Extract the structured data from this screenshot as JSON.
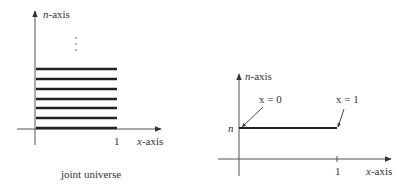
{
  "left_diagram": {
    "y_axis_label_var": "n",
    "y_axis_label_rest": "-axis",
    "x_axis_label_var": "x",
    "x_axis_label_rest": "-axis",
    "x_tick_label": "1",
    "continuation": "⋮",
    "caption": "joint universe",
    "line_count": 7
  },
  "right_diagram": {
    "y_axis_label_var": "n",
    "y_axis_label_rest": "-axis",
    "x_axis_label_var": "x",
    "x_axis_label_rest": "-axis",
    "x_tick_label": "1",
    "y_tick_label": "n",
    "annotation_start": "x = 0",
    "annotation_end": "x = 1"
  },
  "colors": {
    "axis": "#555555",
    "line": "#222222"
  }
}
